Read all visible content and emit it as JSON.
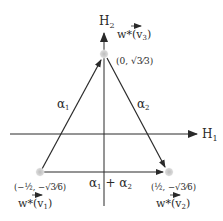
{
  "diagram": {
    "axes": {
      "horizontal_label": "H",
      "horizontal_sub": "1",
      "vertical_label": "H",
      "vertical_sub": "2"
    },
    "vertices": [
      {
        "id": "v3",
        "weight_label": "w*(v",
        "weight_sub": "3",
        "weight_close": ")",
        "coord_label": "(0, √3⁄3)"
      },
      {
        "id": "v1",
        "weight_label": "w*(v",
        "weight_sub": "1",
        "weight_close": ")",
        "coord_label": "(−½, −√3⁄6)"
      },
      {
        "id": "v2",
        "weight_label": "w*(v",
        "weight_sub": "2",
        "weight_close": ")",
        "coord_label": "(½, −√3⁄6)"
      }
    ],
    "edges": [
      {
        "id": "alpha1",
        "label": "α",
        "sub": "1",
        "from": "v1",
        "to": "v3"
      },
      {
        "id": "alpha2",
        "label": "α",
        "sub": "2",
        "from": "v3",
        "to": "v2"
      },
      {
        "id": "alpha1plus2",
        "label": "α",
        "sub": "1",
        "plus": " + ",
        "label2": "α",
        "sub2": "2",
        "from": "v1",
        "to": "v2"
      }
    ],
    "colors": {
      "line": "#2a2a2a",
      "vertex_dot": "#c8c8c8"
    }
  }
}
